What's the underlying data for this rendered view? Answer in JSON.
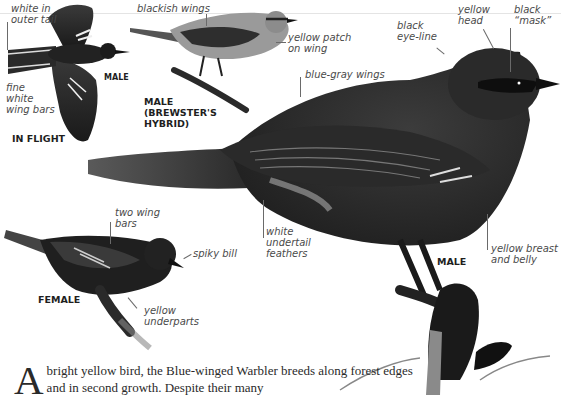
{
  "species": "Blue-winged Warbler",
  "figures": {
    "in_flight": {
      "caption": "IN FLIGHT",
      "sex_label": "MALE",
      "annotations": [
        "white in\nouter tail",
        "fine\nwhite\nwing bars"
      ]
    },
    "brewsters_hybrid": {
      "caption": "MALE\n(BREWSTER'S\nHYBRID)",
      "annotations": [
        "blackish wings",
        "yellow patch\non wing"
      ]
    },
    "male_main": {
      "caption": "MALE",
      "annotations": [
        "black\neye-line",
        "yellow\nhead",
        "black\n“mask”",
        "blue-gray wings",
        "white\nundertail\nfeathers",
        "yellow breast\nand belly"
      ]
    },
    "female": {
      "caption": "FEMALE",
      "annotations": [
        "two wing\nbars",
        "spiky bill",
        "yellow\nunderparts"
      ]
    }
  },
  "description": {
    "drop_cap": "A",
    "text": "bright yellow bird, the Blue-winged Warbler breeds along forest edges and in second growth. Despite their many"
  }
}
